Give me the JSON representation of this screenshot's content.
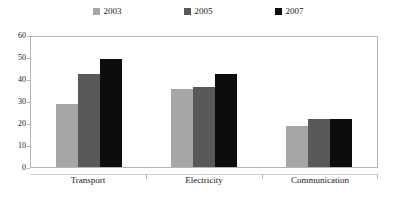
{
  "chart_data": {
    "type": "bar",
    "title": "",
    "xlabel": "",
    "ylabel": "",
    "ylim": [
      0,
      60
    ],
    "yticks": [
      0,
      10,
      20,
      30,
      40,
      50,
      60
    ],
    "grid": false,
    "legend_position": "top",
    "categories": [
      "Transport",
      "Electricity",
      "Communication"
    ],
    "series": [
      {
        "name": "2003",
        "color": "#a6a6a6",
        "values": [
          29,
          36,
          19
        ]
      },
      {
        "name": "2005",
        "color": "#595959",
        "values": [
          43,
          37,
          22
        ]
      },
      {
        "name": "2007",
        "color": "#0d0d0d",
        "values": [
          50,
          43,
          22
        ]
      }
    ]
  },
  "legend": {
    "items": [
      {
        "label": "2003",
        "color": "#a6a6a6"
      },
      {
        "label": "2005",
        "color": "#595959"
      },
      {
        "label": "2007",
        "color": "#0d0d0d"
      }
    ]
  },
  "y_axis": {
    "ticks": [
      "60",
      "50",
      "40",
      "30",
      "20",
      "10",
      "0"
    ]
  },
  "x_axis": {
    "ticks": [
      "Transport",
      "Electricity",
      "Communication"
    ]
  }
}
